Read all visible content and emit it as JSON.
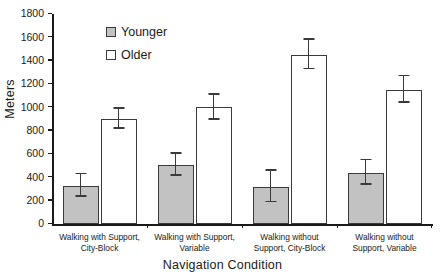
{
  "chart_data": {
    "type": "bar",
    "title": "",
    "xlabel": "Navigation Condition",
    "ylabel": "Meters",
    "ylim": [
      0,
      1800
    ],
    "yticks": [
      0,
      200,
      400,
      600,
      800,
      1000,
      1200,
      1400,
      1600,
      1800
    ],
    "grid": false,
    "legend_position": "top-left-inside",
    "categories": [
      "Walking with Support,\nCity-Block",
      "Walking with Support,\nVariable",
      "Walking without\nSupport, City-Block",
      "Walking without\nSupport, Variable"
    ],
    "series": [
      {
        "name": "Younger",
        "color": "#c2c2c2",
        "values": [
          330,
          505,
          320,
          440
        ],
        "errors": [
          95,
          95,
          135,
          105
        ]
      },
      {
        "name": "Older",
        "color": "#ffffff",
        "values": [
          900,
          1000,
          1450,
          1150
        ],
        "errors": [
          85,
          110,
          125,
          115
        ]
      }
    ]
  },
  "axis": {
    "y_title": "Meters",
    "x_title": "Navigation Condition",
    "y_tick_labels": [
      "0",
      "200",
      "400",
      "600",
      "800",
      "1000",
      "1200",
      "1400",
      "1600",
      "1800"
    ]
  },
  "legend": {
    "items": [
      {
        "label": "Younger",
        "swatch": "filled-gray-square-icon"
      },
      {
        "label": "Older",
        "swatch": "open-white-square-icon"
      }
    ]
  },
  "categories_display": [
    "Walking with Support,\nCity-Block",
    "Walking with Support,\nVariable",
    "Walking without\nSupport, City-Block",
    "Walking without\nSupport, Variable"
  ]
}
